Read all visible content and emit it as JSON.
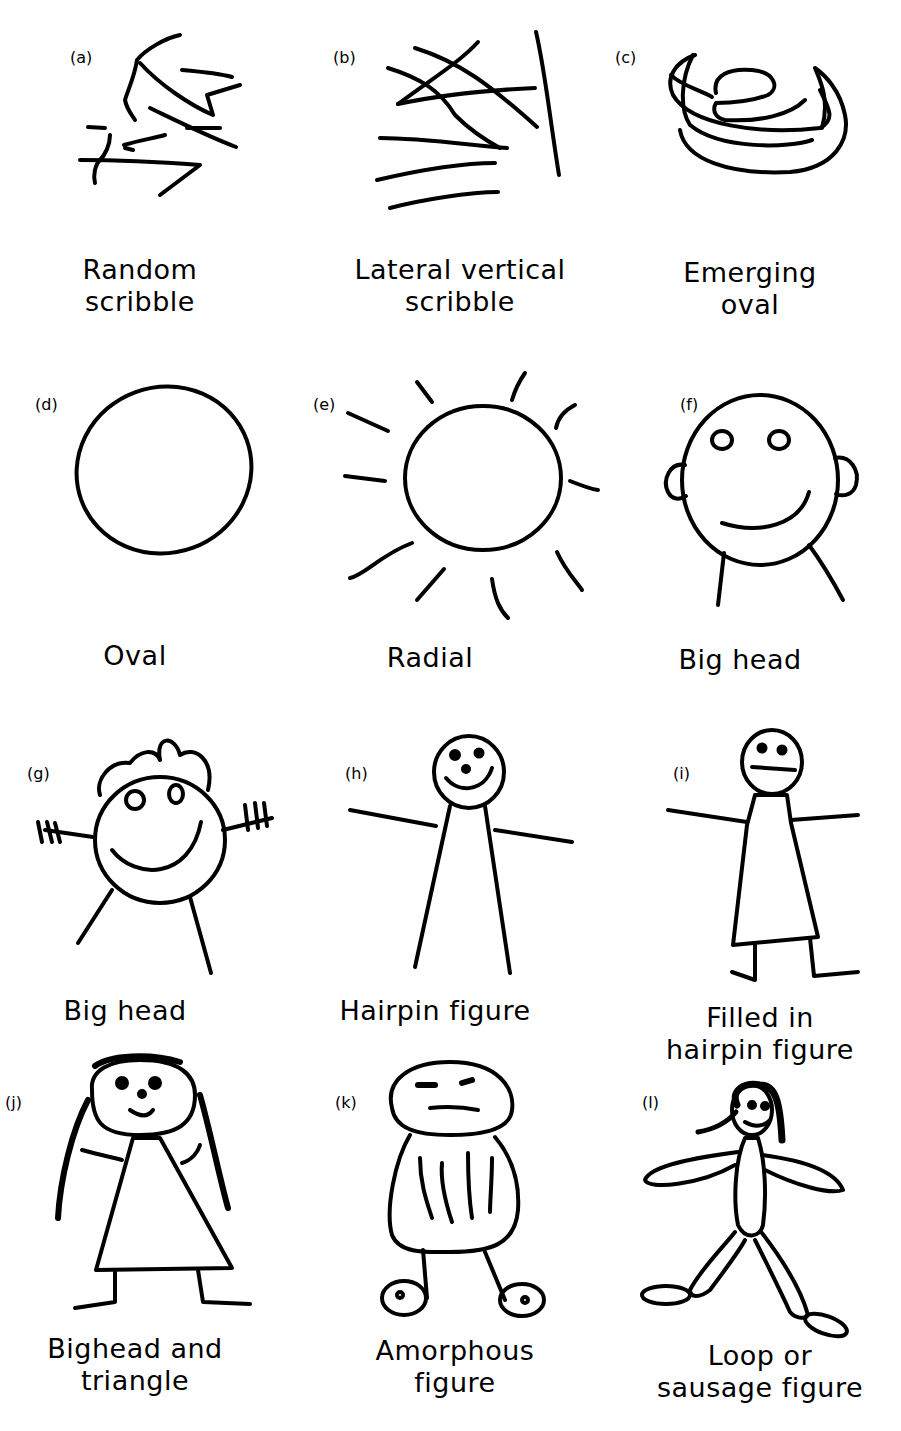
{
  "figure": {
    "panels": [
      {
        "id": "a",
        "tag": "(a)",
        "caption_lines": [
          "Random",
          "scribble"
        ]
      },
      {
        "id": "b",
        "tag": "(b)",
        "caption_lines": [
          "Lateral vertical",
          "scribble"
        ]
      },
      {
        "id": "c",
        "tag": "(c)",
        "caption_lines": [
          "Emerging",
          "oval"
        ]
      },
      {
        "id": "d",
        "tag": "(d)",
        "caption_lines": [
          "Oval"
        ]
      },
      {
        "id": "e",
        "tag": "(e)",
        "caption_lines": [
          "Radial"
        ]
      },
      {
        "id": "f",
        "tag": "(f)",
        "caption_lines": [
          "Big head"
        ]
      },
      {
        "id": "g",
        "tag": "(g)",
        "caption_lines": [
          "Big head"
        ]
      },
      {
        "id": "h",
        "tag": "(h)",
        "caption_lines": [
          "Hairpin figure"
        ]
      },
      {
        "id": "i",
        "tag": "(i)",
        "caption_lines": [
          "Filled in",
          "hairpin figure"
        ]
      },
      {
        "id": "j",
        "tag": "(j)",
        "caption_lines": [
          "Bighead and",
          "triangle"
        ]
      },
      {
        "id": "k",
        "tag": "(k)",
        "caption_lines": [
          "Amorphous",
          "figure"
        ]
      },
      {
        "id": "l",
        "tag": "(l)",
        "caption_lines": [
          "Loop or",
          "sausage figure"
        ]
      }
    ]
  },
  "colors": {
    "ink": "#000000",
    "background": "#ffffff"
  }
}
